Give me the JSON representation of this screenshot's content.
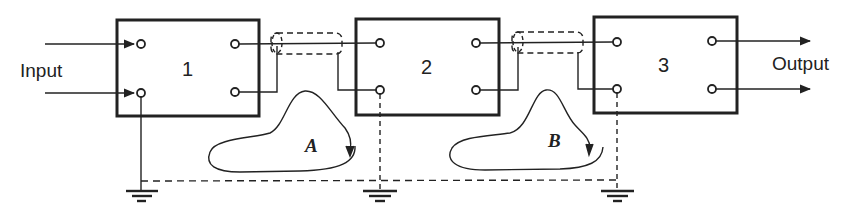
{
  "diagram": {
    "title": "",
    "labels": {
      "input": "Input",
      "output": "Output"
    },
    "blocks": [
      {
        "id": "1",
        "label": "1"
      },
      {
        "id": "2",
        "label": "2"
      },
      {
        "id": "3",
        "label": "3"
      }
    ],
    "loops": [
      {
        "id": "A",
        "label": "A"
      },
      {
        "id": "B",
        "label": "B"
      }
    ],
    "connections": [
      {
        "from": "Input",
        "to": "1",
        "type": "arrow-pair"
      },
      {
        "from": "1",
        "to": "2",
        "type": "shielded-cable"
      },
      {
        "from": "2",
        "to": "3",
        "type": "shielded-cable"
      },
      {
        "from": "3",
        "to": "Output",
        "type": "arrow-pair"
      }
    ],
    "grounds": 3,
    "ground_bus": "dashed",
    "colors": {
      "line": "#222222",
      "background": "#ffffff"
    }
  }
}
